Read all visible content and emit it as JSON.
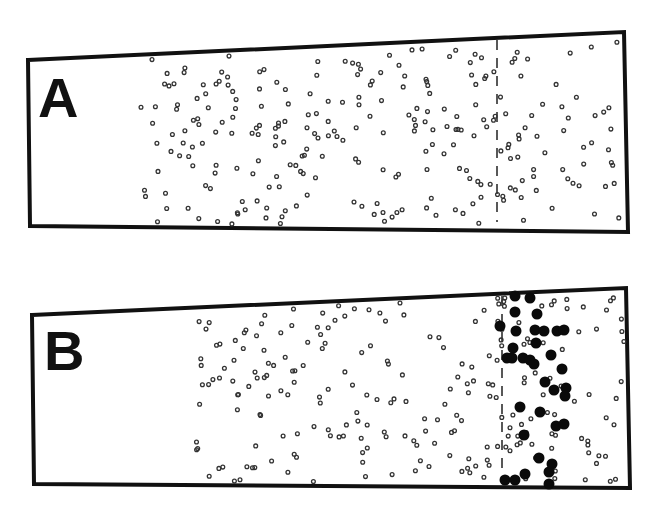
{
  "panels": [
    {
      "label": "A",
      "outline": [
        [
          28,
          60
        ],
        [
          624,
          32
        ],
        [
          628,
          232
        ],
        [
          30,
          226
        ]
      ],
      "dashed_x": 497,
      "dashed_y": [
        40,
        222
      ],
      "small_dots_seed": 7,
      "small_dots_count": 260,
      "small_dots_xrange": [
        138,
        624
      ],
      "large_dots": []
    },
    {
      "label": "B",
      "outline": [
        [
          32,
          315
        ],
        [
          626,
          288
        ],
        [
          630,
          488
        ],
        [
          34,
          484
        ]
      ],
      "dashed_x": 502,
      "dashed_y": [
        296,
        480
      ],
      "small_dots_seed": 19,
      "small_dots_count": 230,
      "small_dots_xrange": [
        196,
        626
      ],
      "large_dots": [
        [
          515,
          296
        ],
        [
          530,
          298
        ],
        [
          515,
          312
        ],
        [
          537,
          314
        ],
        [
          500,
          326
        ],
        [
          516,
          331
        ],
        [
          535,
          330
        ],
        [
          544,
          331
        ],
        [
          557,
          331
        ],
        [
          564,
          330
        ],
        [
          513,
          348
        ],
        [
          536,
          343
        ],
        [
          507,
          358
        ],
        [
          512,
          358
        ],
        [
          523,
          358
        ],
        [
          530,
          360
        ],
        [
          534,
          364
        ],
        [
          551,
          355
        ],
        [
          562,
          369
        ],
        [
          545,
          382
        ],
        [
          554,
          390
        ],
        [
          566,
          388
        ],
        [
          565,
          396
        ],
        [
          520,
          407
        ],
        [
          540,
          412
        ],
        [
          556,
          426
        ],
        [
          564,
          424
        ],
        [
          524,
          435
        ],
        [
          539,
          458
        ],
        [
          552,
          464
        ],
        [
          505,
          480
        ],
        [
          515,
          480
        ],
        [
          525,
          474
        ],
        [
          549,
          472
        ],
        [
          549,
          484
        ]
      ]
    }
  ],
  "colors": {
    "outline": "#111111",
    "dot": "#333333",
    "large_dot": "#0a0a0a",
    "background": "#ffffff"
  }
}
